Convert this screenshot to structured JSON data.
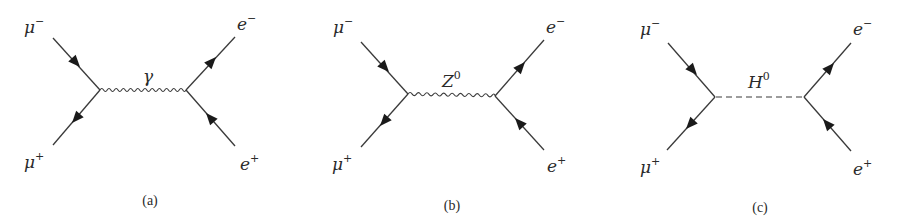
{
  "figure": {
    "diagrams": [
      {
        "id": "a",
        "caption": "(a)",
        "mediator": {
          "symbol": "γ",
          "superscript": "",
          "line_style": "wavy"
        },
        "incoming": [
          {
            "particle": "μ",
            "charge": "−",
            "position": "top-left"
          },
          {
            "particle": "μ",
            "charge": "+",
            "position": "bottom-left"
          }
        ],
        "outgoing": [
          {
            "particle": "e",
            "charge": "−",
            "position": "top-right"
          },
          {
            "particle": "e",
            "charge": "+",
            "position": "bottom-right"
          }
        ]
      },
      {
        "id": "b",
        "caption": "(b)",
        "mediator": {
          "symbol": "Z",
          "superscript": "0",
          "line_style": "wavy"
        },
        "incoming": [
          {
            "particle": "μ",
            "charge": "−",
            "position": "top-left"
          },
          {
            "particle": "μ",
            "charge": "+",
            "position": "bottom-left"
          }
        ],
        "outgoing": [
          {
            "particle": "e",
            "charge": "−",
            "position": "top-right"
          },
          {
            "particle": "e",
            "charge": "+",
            "position": "bottom-right"
          }
        ]
      },
      {
        "id": "c",
        "caption": "(c)",
        "mediator": {
          "symbol": "H",
          "superscript": "0",
          "line_style": "dashed"
        },
        "incoming": [
          {
            "particle": "μ",
            "charge": "−",
            "position": "top-left"
          },
          {
            "particle": "μ",
            "charge": "+",
            "position": "bottom-left"
          }
        ],
        "outgoing": [
          {
            "particle": "e",
            "charge": "−",
            "position": "top-right"
          },
          {
            "particle": "e",
            "charge": "+",
            "position": "bottom-right"
          }
        ]
      }
    ]
  },
  "colors": {
    "line": "#3a3a3a",
    "arrow": "#1a1a1a",
    "text": "#2a2a2a",
    "background": "#ffffff"
  }
}
